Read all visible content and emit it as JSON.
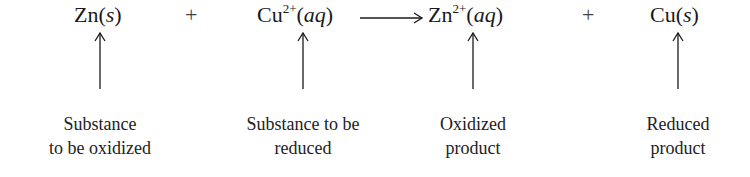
{
  "equation": {
    "reactant1": {
      "symbol": "Zn",
      "charge": "",
      "state": "s"
    },
    "plus1": "+",
    "reactant2": {
      "symbol": "Cu",
      "charge": "2+",
      "state": "aq"
    },
    "arrow": "reaction-arrow-right",
    "product1": {
      "symbol": "Zn",
      "charge": "2+",
      "state": "aq"
    },
    "plus2": "+",
    "product2": {
      "symbol": "Cu",
      "charge": "",
      "state": "s"
    }
  },
  "labels": [
    {
      "line1": "Substance",
      "line2": "to be oxidized"
    },
    {
      "line1": "Substance to be",
      "line2": "reduced"
    },
    {
      "line1": "Oxidized",
      "line2": "product"
    },
    {
      "line1": "Reduced",
      "line2": "product"
    }
  ],
  "colors": {
    "text": "#1a1a1a",
    "background": "#ffffff"
  }
}
